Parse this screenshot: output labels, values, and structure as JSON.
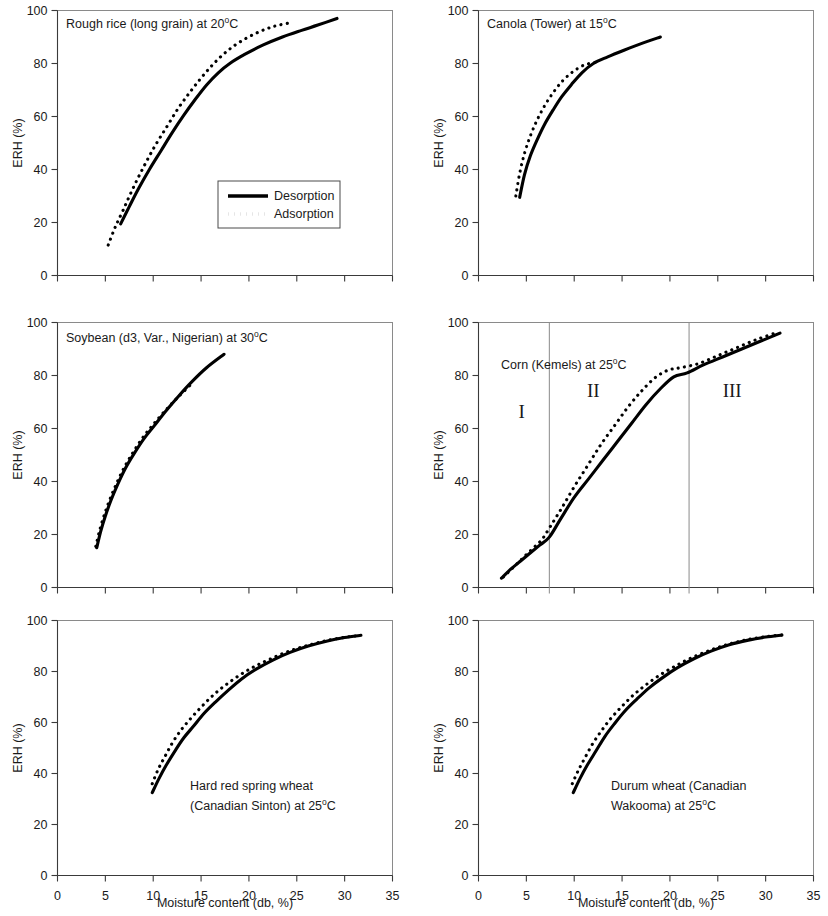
{
  "figure": {
    "x_axis_title": "Moisture content (db, %)",
    "y_axis_title": "ERH (%)",
    "x_ticks": [
      "0",
      "5",
      "10",
      "15",
      "20",
      "25",
      "30",
      "35"
    ],
    "y_ticks": [
      "0",
      "20",
      "40",
      "60",
      "80",
      "100"
    ]
  },
  "legend": {
    "desorption": "Desorption",
    "adsorption": "Adsorption"
  },
  "panels": {
    "rough_rice": {
      "title_main": "Rough rice (long grain) at 20",
      "title_sup": "o",
      "title_tail": "C"
    },
    "canola": {
      "title_main": "Canola (Tower) at 15",
      "title_sup": "o",
      "title_tail": "C"
    },
    "soybean": {
      "title_main": "Soybean (d3, Var., Nigerian) at 30",
      "title_sup": "o",
      "title_tail": "C"
    },
    "corn": {
      "title_main": "Corn (Kemels) at 25",
      "title_sup": "o",
      "title_tail": "C",
      "region_1": "I",
      "region_2": "II",
      "region_3": "III"
    },
    "hrs_wheat": {
      "title_line1": "Hard red spring wheat",
      "title_line2_main": "(Canadian Sinton)  at 25",
      "title_sup": "o",
      "title_tail": "C"
    },
    "durum": {
      "title_line1": "Durum wheat (Canadian",
      "title_line2_main": "Wakooma)  at 25",
      "title_sup": "o",
      "title_tail": "C"
    }
  },
  "chart_data": [
    {
      "id": "rough_rice",
      "type": "line",
      "title": "Rough rice (long grain) at 20°C",
      "xlabel": "Moisture content (db, %)",
      "ylabel": "ERH (%)",
      "xlim": [
        0,
        35
      ],
      "ylim": [
        0,
        100
      ],
      "grid": false,
      "legend_position": "inside-lower-right",
      "series": [
        {
          "name": "Desorption",
          "style": "solid",
          "x": [
            6.6,
            7.5,
            8.5,
            9.6,
            10.8,
            12.0,
            13.2,
            14.4,
            15.6,
            16.8,
            18.0,
            19.6,
            21.5,
            23.5,
            25.5,
            27.2,
            29.2
          ],
          "y": [
            19.5,
            26.0,
            33.0,
            40.0,
            47.0,
            54.0,
            60.5,
            66.5,
            72.0,
            76.5,
            80.0,
            83.5,
            87.0,
            90.0,
            92.5,
            94.5,
            97.0
          ]
        },
        {
          "name": "Adsorption",
          "style": "dotted",
          "x": [
            5.3,
            6.0,
            6.9,
            7.9,
            9.0,
            10.2,
            11.4,
            12.6,
            13.8,
            15.0,
            16.2,
            17.5,
            19.0,
            20.8,
            22.6,
            24.5
          ],
          "y": [
            11.5,
            18.0,
            25.0,
            33.0,
            41.0,
            49.0,
            56.0,
            63.0,
            69.0,
            74.5,
            79.5,
            84.0,
            88.0,
            91.5,
            94.0,
            95.5
          ]
        }
      ]
    },
    {
      "id": "canola",
      "type": "line",
      "title": "Canola (Tower) at 15°C",
      "xlabel": "Moisture content (db, %)",
      "ylabel": "ERH (%)",
      "xlim": [
        0,
        35
      ],
      "ylim": [
        0,
        100
      ],
      "grid": false,
      "series": [
        {
          "name": "Desorption",
          "style": "solid",
          "x": [
            4.3,
            4.8,
            5.4,
            6.1,
            6.9,
            7.8,
            8.7,
            9.7,
            10.8,
            12.0,
            13.5,
            15.2,
            17.0,
            19.0
          ],
          "y": [
            29.5,
            38.0,
            45.0,
            51.0,
            57.0,
            62.5,
            67.5,
            72.0,
            76.5,
            80.0,
            82.5,
            85.0,
            87.5,
            90.0
          ]
        },
        {
          "name": "Adsorption",
          "style": "dotted",
          "x": [
            3.9,
            4.3,
            4.8,
            5.4,
            6.1,
            6.9,
            7.8,
            8.8,
            9.9,
            11.1,
            12.3
          ],
          "y": [
            30.0,
            38.5,
            46.0,
            52.5,
            58.5,
            64.0,
            69.0,
            73.5,
            77.0,
            79.5,
            80.5
          ]
        }
      ]
    },
    {
      "id": "soybean",
      "type": "line",
      "title": "Soybean (d3, Var., Nigerian) at 30°C",
      "xlabel": "Moisture content (db, %)",
      "ylabel": "ERH (%)",
      "xlim": [
        0,
        35
      ],
      "ylim": [
        0,
        100
      ],
      "grid": false,
      "series": [
        {
          "name": "Desorption",
          "style": "solid",
          "x": [
            4.1,
            4.5,
            5.0,
            5.6,
            6.3,
            7.1,
            8.0,
            9.0,
            10.1,
            11.3,
            12.6,
            14.0,
            15.6,
            17.4
          ],
          "y": [
            15.0,
            21.0,
            27.0,
            33.0,
            39.0,
            45.0,
            50.5,
            56.0,
            61.0,
            66.5,
            72.0,
            77.5,
            83.0,
            88.0
          ]
        },
        {
          "name": "Adsorption",
          "style": "dotted",
          "x": [
            4.0,
            4.4,
            4.9,
            5.5,
            6.2,
            7.0,
            7.9,
            8.9,
            10.0,
            11.2,
            12.5,
            13.9
          ],
          "y": [
            15.5,
            21.5,
            27.5,
            33.5,
            39.5,
            45.5,
            51.0,
            56.5,
            61.5,
            66.5,
            71.5,
            76.5
          ]
        }
      ]
    },
    {
      "id": "corn",
      "type": "line",
      "title": "Corn (Kemels) at 25°C",
      "xlabel": "Moisture content (db, %)",
      "ylabel": "ERH (%)",
      "xlim": [
        0,
        35
      ],
      "ylim": [
        0,
        100
      ],
      "grid": false,
      "annotations": [
        {
          "text": "I",
          "x": 4.5,
          "y": 64
        },
        {
          "text": "II",
          "x": 12.0,
          "y": 72
        },
        {
          "text": "III",
          "x": 26.5,
          "y": 72
        }
      ],
      "region_boundaries": [
        7.4,
        22.0
      ],
      "series": [
        {
          "name": "Desorption",
          "style": "solid",
          "x": [
            2.4,
            3.4,
            4.4,
            5.4,
            6.4,
            7.4,
            8.6,
            10.0,
            11.5,
            13.0,
            14.5,
            16.0,
            17.5,
            19.0,
            20.4,
            21.8,
            23.5,
            25.5,
            27.5,
            29.5,
            31.5
          ],
          "y": [
            3.5,
            7.0,
            10.0,
            13.0,
            16.0,
            19.0,
            26.0,
            34.0,
            41.0,
            48.0,
            55.0,
            62.0,
            69.0,
            75.0,
            79.5,
            81.0,
            84.0,
            87.0,
            90.0,
            93.0,
            96.0
          ]
        },
        {
          "name": "Adsorption",
          "style": "dotted",
          "x": [
            2.6,
            3.6,
            4.6,
            5.6,
            6.6,
            7.5,
            8.7,
            10.0,
            11.4,
            12.8,
            14.2,
            15.6,
            17.0,
            18.4,
            19.8,
            21.2,
            23.0,
            25.0,
            27.0,
            29.0,
            31.0
          ],
          "y": [
            4.0,
            7.5,
            11.0,
            14.5,
            18.0,
            23.0,
            30.0,
            38.0,
            46.0,
            54.0,
            61.0,
            68.0,
            74.0,
            79.0,
            82.0,
            83.0,
            84.5,
            87.5,
            90.5,
            93.5,
            96.0
          ]
        }
      ]
    },
    {
      "id": "hrs_wheat",
      "type": "line",
      "title": "Hard red spring wheat (Canadian Sinton) at 25°C",
      "xlabel": "Moisture content (db, %)",
      "ylabel": "ERH (%)",
      "xlim": [
        0,
        35
      ],
      "ylim": [
        0,
        100
      ],
      "grid": false,
      "series": [
        {
          "name": "Desorption",
          "style": "solid",
          "x": [
            9.9,
            10.6,
            11.4,
            12.3,
            13.2,
            14.2,
            15.3,
            16.5,
            17.8,
            19.2,
            20.8,
            22.5,
            24.3,
            26.2,
            28.2,
            30.0,
            31.7
          ],
          "y": [
            32.5,
            38.0,
            43.5,
            49.0,
            54.0,
            58.5,
            63.5,
            68.0,
            72.5,
            77.0,
            81.0,
            84.5,
            87.5,
            90.0,
            92.0,
            93.3,
            94.2
          ]
        },
        {
          "name": "Adsorption",
          "style": "dotted",
          "x": [
            9.9,
            10.5,
            11.2,
            12.0,
            12.9,
            13.9,
            15.0,
            16.2,
            17.5,
            19.0,
            20.6,
            22.3,
            24.2,
            26.2,
            28.2,
            30.2,
            31.7
          ],
          "y": [
            36.0,
            41.5,
            46.5,
            52.0,
            57.0,
            61.5,
            66.0,
            70.5,
            74.5,
            78.5,
            82.0,
            85.0,
            88.0,
            90.3,
            92.2,
            93.5,
            94.2
          ]
        }
      ]
    },
    {
      "id": "durum",
      "type": "line",
      "title": "Durum wheat (Canadian Wakooma) at 25°C",
      "xlabel": "Moisture content (db, %)",
      "ylabel": "ERH (%)",
      "xlim": [
        0,
        35
      ],
      "ylim": [
        0,
        100
      ],
      "grid": false,
      "series": [
        {
          "name": "Desorption",
          "style": "solid",
          "x": [
            9.9,
            10.6,
            11.4,
            12.3,
            13.2,
            14.2,
            15.3,
            16.5,
            17.8,
            19.2,
            20.8,
            22.5,
            24.3,
            26.2,
            28.2,
            30.0,
            31.7
          ],
          "y": [
            32.5,
            38.0,
            43.5,
            49.0,
            54.5,
            59.5,
            64.5,
            69.0,
            73.5,
            77.5,
            81.5,
            85.0,
            88.0,
            90.5,
            92.3,
            93.5,
            94.3
          ]
        },
        {
          "name": "Adsorption",
          "style": "dotted",
          "x": [
            9.8,
            10.4,
            11.1,
            11.9,
            12.8,
            13.8,
            14.9,
            16.1,
            17.4,
            18.9,
            20.5,
            22.2,
            24.1,
            26.1,
            28.1,
            30.1,
            31.7
          ],
          "y": [
            36.0,
            41.0,
            46.0,
            51.5,
            56.5,
            61.5,
            66.0,
            70.5,
            74.5,
            78.5,
            82.0,
            85.3,
            88.2,
            90.7,
            92.5,
            93.7,
            94.3
          ]
        }
      ]
    }
  ]
}
